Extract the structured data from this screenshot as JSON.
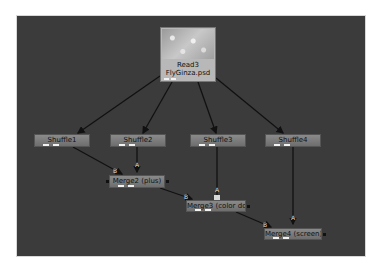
{
  "node_graph": {
    "read_node": {
      "name": "Read3",
      "file": "FlyGinza.psd"
    },
    "shuffle_nodes": [
      {
        "label": "Shuffle1"
      },
      {
        "label": "Shuffle2"
      },
      {
        "label": "Shuffle3"
      },
      {
        "label": "Shuffle4"
      }
    ],
    "merge_nodes": [
      {
        "label": "Merge2 (plus)"
      },
      {
        "label": "Merge3 (color dodge)"
      },
      {
        "label": "Merge4 (screen)"
      }
    ],
    "input_labels": {
      "a": "A",
      "b": "B"
    },
    "colors": {
      "canvas": "#3b3b3b",
      "node": "#7c7c7c",
      "wire": "#111111"
    }
  }
}
